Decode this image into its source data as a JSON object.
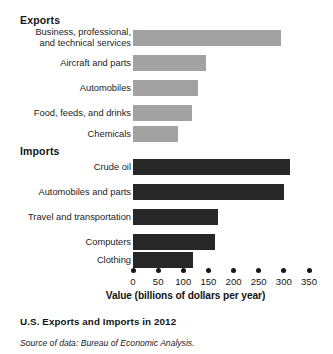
{
  "figure": {
    "caption": "U.S. Exports and Imports in 2012",
    "source_note": "Source of data: Bureau of Economic Analysis.",
    "exports_heading": "Exports",
    "imports_heading": "Imports"
  },
  "chart_data": {
    "type": "bar",
    "orientation": "horizontal",
    "title": "U.S. Exports and Imports in 2012",
    "xlabel": "Value (billions of dollars per year)",
    "ylabel": "",
    "xlim": [
      0,
      350
    ],
    "xticks": [
      0,
      50,
      100,
      150,
      200,
      250,
      300,
      350
    ],
    "xtick_labels": [
      "0",
      "50",
      "100",
      "150",
      "200",
      "250",
      "300",
      "350"
    ],
    "grid": false,
    "legend": "none",
    "units": "billions of dollars per year",
    "colors": {
      "exports_bar": "#a2a2a2",
      "imports_bar": "#272727",
      "text": "#17181a",
      "background": "#ffffff"
    },
    "groups": [
      {
        "name": "Exports",
        "color": "#a2a2a2",
        "categories": [
          "Business, professional,\nand technical services",
          "Aircraft and parts",
          "Automobiles",
          "Food, feeds, and drinks",
          "Chemicals"
        ],
        "values": [
          295,
          145,
          130,
          117,
          90
        ]
      },
      {
        "name": "Imports",
        "color": "#272727",
        "categories": [
          "Crude oil",
          "Automobiles and parts",
          "Travel and transportation",
          "Computers",
          "Clothing"
        ],
        "values": [
          313,
          300,
          170,
          163,
          120
        ]
      }
    ]
  },
  "rows": [
    {
      "label": "Business, professional,\nand technical services",
      "value": 295,
      "group": "exports",
      "lines": 2,
      "top": 30
    },
    {
      "label": "Aircraft and parts",
      "value": 145,
      "group": "exports",
      "lines": 1,
      "top": 55
    },
    {
      "label": "Automobiles",
      "value": 130,
      "group": "exports",
      "lines": 1,
      "top": 80
    },
    {
      "label": "Food, feeds, and drinks",
      "value": 117,
      "group": "exports",
      "lines": 1,
      "top": 105
    },
    {
      "label": "Chemicals",
      "value": 90,
      "group": "exports",
      "lines": 1,
      "top": 126
    },
    {
      "label": "Crude oil",
      "value": 313,
      "group": "imports",
      "lines": 1,
      "top": 159
    },
    {
      "label": "Automobiles and parts",
      "value": 300,
      "group": "imports",
      "lines": 1,
      "top": 184
    },
    {
      "label": "Travel and transportation",
      "value": 170,
      "group": "imports",
      "lines": 1,
      "top": 209
    },
    {
      "label": "Computers",
      "value": 163,
      "group": "imports",
      "lines": 1,
      "top": 234
    },
    {
      "label": "Clothing",
      "value": 120,
      "group": "imports",
      "lines": 1,
      "top": 252
    }
  ]
}
